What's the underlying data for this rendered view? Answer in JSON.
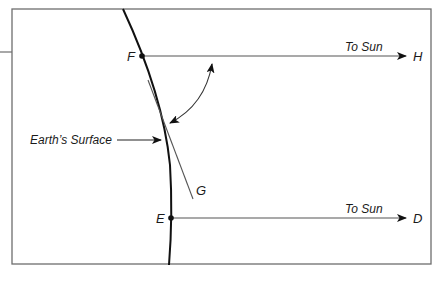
{
  "diagram": {
    "type": "sun-angle-on-earth-surface",
    "frame": {
      "x": 12,
      "y": 9,
      "width": 419,
      "height": 255
    },
    "colors": {
      "frame": "#6e6e6e",
      "surface": "#111111",
      "rays": "#555555",
      "tangent": "#555555",
      "text": "#1a1a1a"
    },
    "labels": {
      "earth_surface": "Earth’s Surface",
      "ray_top": "To Sun",
      "ray_bottom": "To Sun",
      "point_F": "F",
      "point_H": "H",
      "point_G": "G",
      "point_E": "E",
      "point_D": "D"
    },
    "points": {
      "F": {
        "x": 142,
        "y": 56
      },
      "H": {
        "x": 419,
        "y": 56
      },
      "E": {
        "x": 171,
        "y": 218
      },
      "D": {
        "x": 414,
        "y": 218
      },
      "G": {
        "x": 193,
        "y": 199
      }
    },
    "elements": [
      "Earth's curved surface line",
      "Ray from F toward Sun ending at H",
      "Ray from E toward Sun ending at D",
      "Tangent line from F to G",
      "Double-headed curved arrow indicating angle between ray FH and tangent FG",
      "Arrow pointing to Earth's surface"
    ]
  }
}
